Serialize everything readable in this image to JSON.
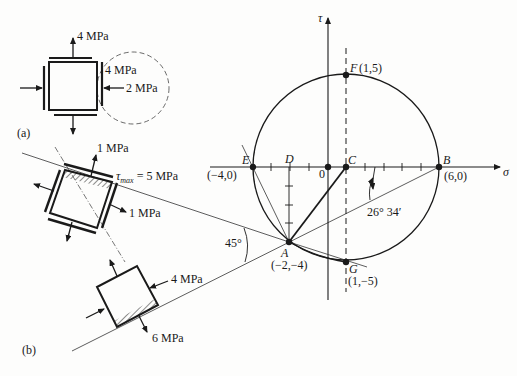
{
  "figure": {
    "part_labels": {
      "a": "(a)",
      "b": "(b)"
    },
    "element_a": {
      "sigma_y_label": "4 MPa",
      "tau_label": "4 MPa",
      "sigma_x_label": "2 MPa"
    },
    "element_b1": {
      "normal_top_label": "1 MPa",
      "shear_label_prefix": "τ",
      "shear_label_sub": "max",
      "shear_label_value": " = 5 MPa",
      "normal_right_label": "1 MPa"
    },
    "element_b2": {
      "compression_label": "4 MPa",
      "tension_label": "6 MPa"
    },
    "mohr_circle": {
      "axis_sigma": "σ",
      "axis_tau": "τ",
      "origin_label": "0",
      "center": [
        1,
        0
      ],
      "radius": 5,
      "points": {
        "A": {
          "name": "A",
          "coords": "(−2,−4)",
          "value": [
            -2,
            -4
          ]
        },
        "B": {
          "name": "B",
          "coords": "(6,0)",
          "value": [
            6,
            0
          ]
        },
        "C": {
          "name": "C",
          "coords": "",
          "value": [
            1,
            0
          ]
        },
        "D": {
          "name": "D",
          "coords": "",
          "value": [
            -2,
            0
          ]
        },
        "E": {
          "name": "E",
          "coords": "(−4,0)",
          "value": [
            -4,
            0
          ]
        },
        "F": {
          "name": "F",
          "coords": "(1,5)",
          "value": [
            1,
            5
          ]
        },
        "G": {
          "name": "G",
          "coords": "(1,−5)",
          "value": [
            1,
            -5
          ]
        }
      },
      "angles": {
        "principal": "26° 34′",
        "shear": "45°"
      }
    }
  }
}
